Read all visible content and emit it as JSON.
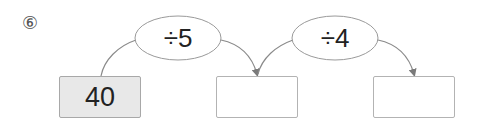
{
  "problem": {
    "number_label": "⑥"
  },
  "operations": [
    {
      "label": "÷5",
      "operator": "÷",
      "operand": 5
    },
    {
      "label": "÷4",
      "operator": "÷",
      "operand": 4
    }
  ],
  "boxes": [
    {
      "value": "40",
      "filled": true
    },
    {
      "value": "",
      "filled": false
    },
    {
      "value": "",
      "filled": false
    }
  ],
  "colors": {
    "line": "#8a8a8a",
    "box_border": "#b3b3b3",
    "filled_box_bg": "#e8e8e8",
    "text": "#222222"
  }
}
